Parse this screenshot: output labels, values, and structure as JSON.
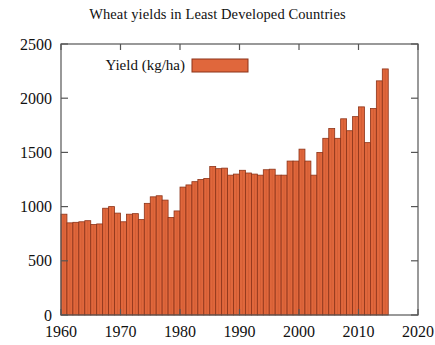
{
  "chart_data": {
    "type": "bar",
    "title": "Wheat yields in Least Developed Countries",
    "xlabel": "",
    "ylabel": "",
    "ylim": [
      0,
      2500
    ],
    "xlim": [
      1960,
      2020
    ],
    "ytick_labels": [
      "0",
      "500",
      "1000",
      "1500",
      "2000",
      "2500"
    ],
    "yticks": [
      0,
      500,
      1000,
      1500,
      2000,
      2500
    ],
    "xtick_labels": [
      "1960",
      "1970",
      "1980",
      "1990",
      "2000",
      "2010",
      "2020"
    ],
    "xticks": [
      1960,
      1970,
      1980,
      1990,
      2000,
      2010,
      2020
    ],
    "grid": false,
    "legend_position": "top-left-inside",
    "legend": [
      {
        "name": "Yield (kg/ha)",
        "color": "#e0673c"
      }
    ],
    "series": [
      {
        "name": "Yield (kg/ha)",
        "color": "#e0673c",
        "categories": [
          1960,
          1961,
          1962,
          1963,
          1964,
          1965,
          1966,
          1967,
          1968,
          1969,
          1970,
          1971,
          1972,
          1973,
          1974,
          1975,
          1976,
          1977,
          1978,
          1979,
          1980,
          1981,
          1982,
          1983,
          1984,
          1985,
          1986,
          1987,
          1988,
          1989,
          1990,
          1991,
          1992,
          1993,
          1994,
          1995,
          1996,
          1997,
          1998,
          1999,
          2000,
          2001,
          2002,
          2003,
          2004,
          2005,
          2006,
          2007,
          2008,
          2009,
          2010,
          2011,
          2012,
          2013,
          2014
        ],
        "values": [
          930,
          850,
          855,
          860,
          870,
          835,
          840,
          985,
          1000,
          940,
          860,
          930,
          935,
          880,
          1030,
          1090,
          1100,
          1060,
          900,
          960,
          1180,
          1200,
          1230,
          1250,
          1260,
          1370,
          1350,
          1355,
          1290,
          1300,
          1335,
          1310,
          1300,
          1290,
          1340,
          1345,
          1290,
          1290,
          1420,
          1420,
          1530,
          1420,
          1290,
          1500,
          1630,
          1720,
          1630,
          1810,
          1700,
          1830,
          1920,
          1590,
          1905,
          2160,
          2270
        ]
      }
    ]
  }
}
